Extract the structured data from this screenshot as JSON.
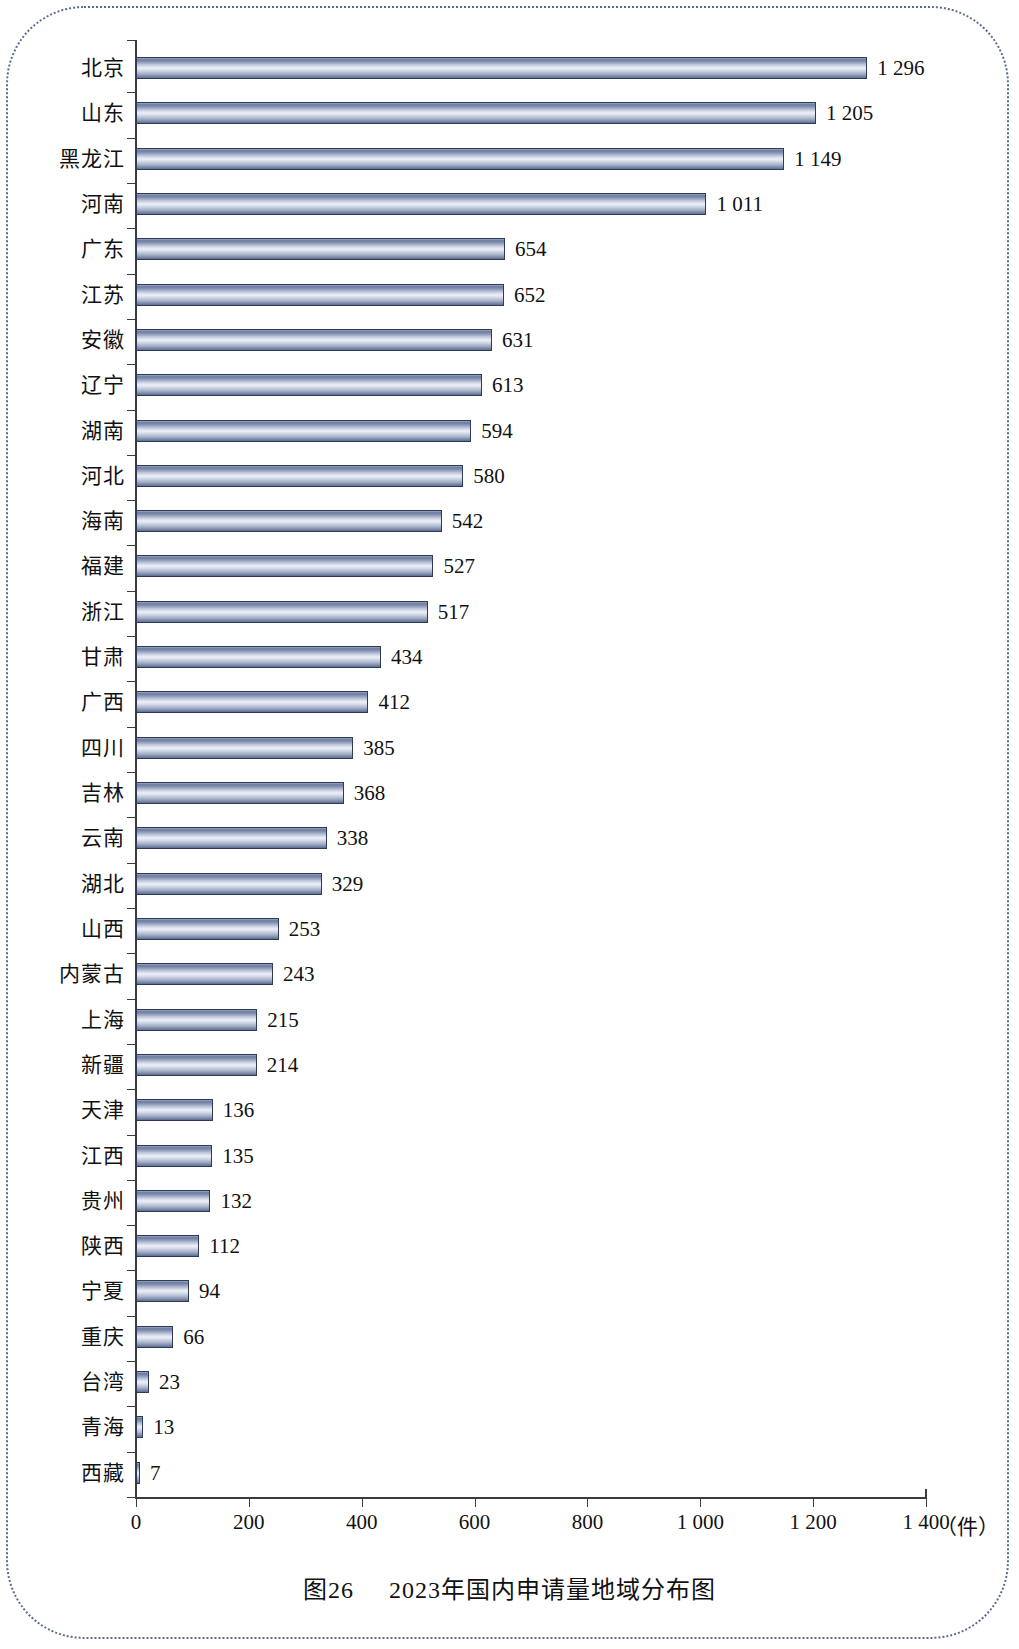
{
  "figure": {
    "caption_number": "图26",
    "caption_title": "2023年国内申请量地域分布图",
    "unit_label": "（件）"
  },
  "chart_data": {
    "type": "bar",
    "orientation": "horizontal",
    "xlabel": "（件）",
    "ylabel": "",
    "xlim": [
      0,
      1400
    ],
    "xticks": [
      0,
      200,
      400,
      600,
      800,
      1000,
      1200,
      1400
    ],
    "xtick_labels": [
      "0",
      "200",
      "400",
      "600",
      "800",
      "1 000",
      "1 200",
      "1 400"
    ],
    "grid": false,
    "legend": null,
    "categories": [
      "北京",
      "山东",
      "黑龙江",
      "河南",
      "广东",
      "江苏",
      "安徽",
      "辽宁",
      "湖南",
      "河北",
      "海南",
      "福建",
      "浙江",
      "甘肃",
      "广西",
      "四川",
      "吉林",
      "云南",
      "湖北",
      "山西",
      "内蒙古",
      "上海",
      "新疆",
      "天津",
      "江西",
      "贵州",
      "陕西",
      "宁夏",
      "重庆",
      "台湾",
      "青海",
      "西藏"
    ],
    "values": [
      1296,
      1205,
      1149,
      1011,
      654,
      652,
      631,
      613,
      594,
      580,
      542,
      527,
      517,
      434,
      412,
      385,
      368,
      338,
      329,
      253,
      243,
      215,
      214,
      136,
      135,
      132,
      112,
      94,
      66,
      23,
      13,
      7
    ],
    "value_labels": [
      "1 296",
      "1 205",
      "1 149",
      "1 011",
      "654",
      "652",
      "631",
      "613",
      "594",
      "580",
      "542",
      "527",
      "517",
      "434",
      "412",
      "385",
      "368",
      "338",
      "329",
      "253",
      "243",
      "215",
      "214",
      "136",
      "135",
      "132",
      "112",
      "94",
      "66",
      "23",
      "13",
      "7"
    ],
    "bar_style": {
      "fill": "cylinder-gradient",
      "light": "#eef1f7",
      "mid": "#9aa6c4",
      "dark": "#5e6c8e",
      "border": "#2e3b55"
    }
  }
}
